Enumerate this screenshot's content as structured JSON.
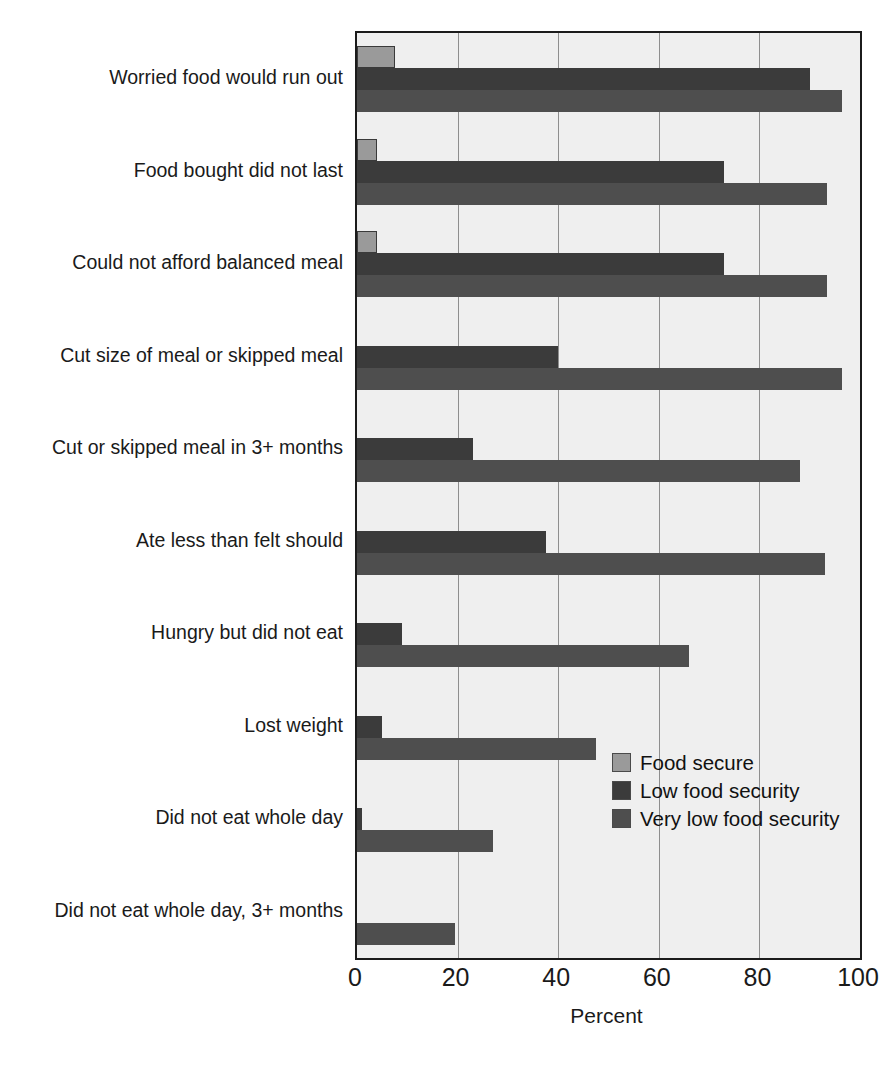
{
  "chart_data": {
    "type": "bar",
    "orientation": "horizontal",
    "title": "",
    "subtitle": "",
    "xlabel": "Percent",
    "ylabel": "",
    "xlim": [
      0,
      100
    ],
    "xticks": [
      0,
      20,
      40,
      60,
      80,
      100
    ],
    "xtick_labels": [
      "0",
      "20",
      "40",
      "60",
      "80",
      "100"
    ],
    "grid": "vertical",
    "legend_position": "inside-right",
    "categories": [
      "Worried food would run out",
      "Food bought did not last",
      "Could not afford balanced meal",
      "Cut size of meal or skipped meal",
      "Cut or skipped meal in 3+ months",
      "Ate less than felt should",
      "Hungry but did not eat",
      "Lost weight",
      "Did not eat whole day",
      "Did not eat whole day, 3+ months"
    ],
    "series": [
      {
        "name": "Food secure",
        "color": "#9a9a9a",
        "values": [
          7.5,
          4.0,
          4.0,
          0,
          0,
          0,
          0,
          0,
          0,
          0
        ]
      },
      {
        "name": "Low food security",
        "color": "#3b3b3b",
        "values": [
          90.0,
          73.0,
          73.0,
          40.0,
          23.0,
          37.5,
          9.0,
          5.0,
          1.0,
          0
        ]
      },
      {
        "name": "Very low food security",
        "color": "#4e4e4e",
        "values": [
          96.5,
          93.5,
          93.5,
          96.5,
          88.0,
          93.0,
          66.0,
          47.5,
          27.0,
          19.5
        ]
      }
    ]
  },
  "legend": {
    "items": [
      {
        "label": "Food secure",
        "color": "#9a9a9a"
      },
      {
        "label": "Low food security",
        "color": "#3b3b3b"
      },
      {
        "label": "Very low food security",
        "color": "#4e4e4e"
      }
    ]
  },
  "axis": {
    "x_title": "Percent"
  }
}
